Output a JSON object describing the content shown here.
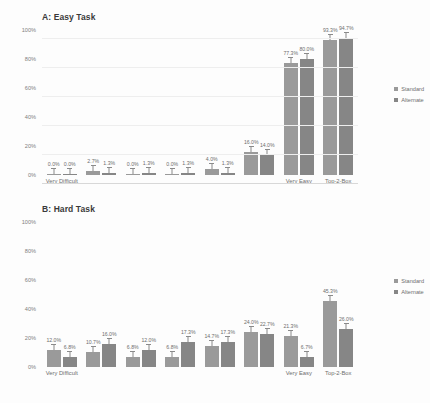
{
  "chart_data": [
    {
      "type": "bar",
      "title": "A: Easy Task",
      "xlabel": "",
      "ylabel": "",
      "ylim": [
        0,
        100
      ],
      "yticks": [
        "0%",
        "20%",
        "40%",
        "60%",
        "80%",
        "100%"
      ],
      "grid": true,
      "legend_position": "right",
      "categories": [
        "Very Difficult",
        "",
        "",
        "",
        "",
        "",
        "Very Easy",
        "Top-2-Box"
      ],
      "xtick_labels_shown": [
        "Very Difficult",
        "Very Easy",
        "Top-2-Box"
      ],
      "series": [
        {
          "name": "Standard",
          "color": "#9a9a9a",
          "values": [
            0.0,
            2.7,
            0.0,
            0.0,
            4.0,
            16.0,
            77.3,
            93.3
          ],
          "labels": [
            "0.0%",
            "2.7%",
            "0.0%",
            "0.0%",
            "4.0%",
            "16.0%",
            "77.3%",
            "93.3%"
          ]
        },
        {
          "name": "Alternate",
          "color": "#868686",
          "values": [
            0.0,
            1.3,
            1.3,
            1.3,
            1.3,
            14.0,
            80.0,
            94.7
          ],
          "labels": [
            "0.0%",
            "1.3%",
            "1.3%",
            "1.3%",
            "1.3%",
            "14.0%",
            "80.0%",
            "94.7%"
          ]
        }
      ]
    },
    {
      "type": "bar",
      "title": "B: Hard Task",
      "xlabel": "",
      "ylabel": "",
      "ylim": [
        0,
        100
      ],
      "yticks": [
        "0%",
        "20%",
        "40%",
        "60%",
        "80%",
        "100%"
      ],
      "grid": true,
      "legend_position": "right",
      "categories": [
        "Very Difficult",
        "",
        "",
        "",
        "",
        "",
        "Very Easy",
        "Top-2-Box"
      ],
      "xtick_labels_shown": [
        "Very Difficult",
        "Very Easy",
        "Top-2-Box"
      ],
      "series": [
        {
          "name": "Standard",
          "color": "#9a9a9a",
          "values": [
            12.0,
            10.7,
            6.8,
            6.8,
            14.7,
            24.0,
            21.3,
            45.3
          ],
          "labels": [
            "12.0%",
            "10.7%",
            "6.8%",
            "6.8%",
            "14.7%",
            "24.0%",
            "21.3%",
            "45.3%"
          ]
        },
        {
          "name": "Alternate",
          "color": "#868686",
          "values": [
            6.8,
            16.0,
            12.0,
            17.3,
            17.3,
            22.7,
            6.7,
            26.0
          ],
          "labels": [
            "6.8%",
            "16.0%",
            "12.0%",
            "17.3%",
            "17.3%",
            "22.7%",
            "6.7%",
            "26.0%"
          ]
        }
      ]
    }
  ],
  "legend": {
    "standard": "Standard",
    "alternate": "Alternate"
  }
}
